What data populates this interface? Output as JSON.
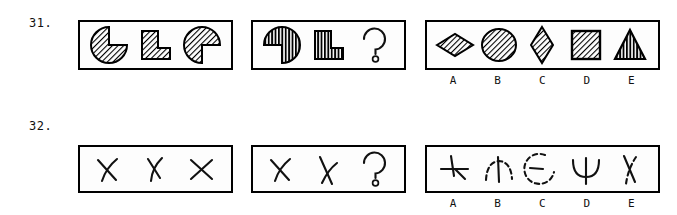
{
  "page": {
    "kind": "abstract-reasoning-test-items",
    "background_color": "#ffffff",
    "ink_color": "#000000"
  },
  "questions": [
    {
      "number": "31.",
      "sequence_panel": {
        "name": "sequence-panel",
        "figures": [
          {
            "name": "pacman-notch-upper-right",
            "shape": "pacman",
            "hatch": "diagonal",
            "notch_direction": "upper-right"
          },
          {
            "name": "l-shape",
            "shape": "l-block",
            "hatch": "diagonal"
          },
          {
            "name": "pacman-notch-lower-right",
            "shape": "pacman",
            "hatch": "diagonal",
            "notch_direction": "lower-right"
          }
        ]
      },
      "problem_panel": {
        "name": "problem-panel",
        "figures": [
          {
            "name": "pacman-notch-lower-left",
            "shape": "pacman",
            "hatch": "vertical",
            "notch_direction": "lower-left"
          },
          {
            "name": "l-shape",
            "shape": "l-block",
            "hatch": "vertical"
          },
          {
            "name": "question-mark",
            "shape": "question-mark",
            "glyph": "?"
          }
        ]
      },
      "options_panel": {
        "name": "options-panel",
        "options": [
          {
            "letter": "A",
            "shape": "wide-diamond",
            "hatch": "diagonal"
          },
          {
            "letter": "B",
            "shape": "circle",
            "hatch": "diagonal"
          },
          {
            "letter": "C",
            "shape": "tall-diamond",
            "hatch": "diagonal"
          },
          {
            "letter": "D",
            "shape": "square",
            "hatch": "diagonal"
          },
          {
            "letter": "E",
            "shape": "triangle",
            "hatch": "vertical"
          }
        ]
      }
    },
    {
      "number": "32.",
      "sequence_panel": {
        "name": "sequence-panel",
        "figures": [
          {
            "name": "x-figure-curved",
            "shape": "x-cross",
            "variant": "curved-leg"
          },
          {
            "name": "x-figure-tilted",
            "shape": "x-cross",
            "variant": "tilted"
          },
          {
            "name": "x-figure-plain",
            "shape": "x-cross",
            "variant": "plain"
          }
        ]
      },
      "problem_panel": {
        "name": "problem-panel",
        "figures": [
          {
            "name": "x-figure-curved",
            "shape": "x-cross",
            "variant": "curved-leg"
          },
          {
            "name": "x-figure-steep",
            "shape": "x-cross",
            "variant": "steep"
          },
          {
            "name": "question-mark",
            "shape": "question-mark",
            "glyph": "?"
          }
        ]
      },
      "options_panel": {
        "name": "options-panel",
        "options": [
          {
            "letter": "A",
            "shape": "cross-asterisk",
            "style": "solid"
          },
          {
            "letter": "B",
            "shape": "arc-with-vertical-line",
            "style": "dashed-arc"
          },
          {
            "letter": "C",
            "shape": "broken-circle-with-line",
            "style": "dashed-arc"
          },
          {
            "letter": "D",
            "shape": "psi-figure",
            "style": "solid"
          },
          {
            "letter": "E",
            "shape": "x-cross-dashed",
            "style": "dashed"
          }
        ]
      }
    }
  ]
}
